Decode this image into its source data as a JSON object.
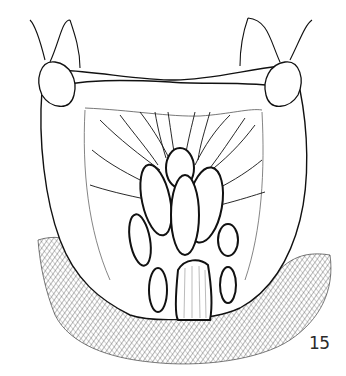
{
  "figure": {
    "number": "15",
    "colors": {
      "ink": "#111111",
      "hatch": "#444444",
      "background": "#ffffff"
    }
  }
}
